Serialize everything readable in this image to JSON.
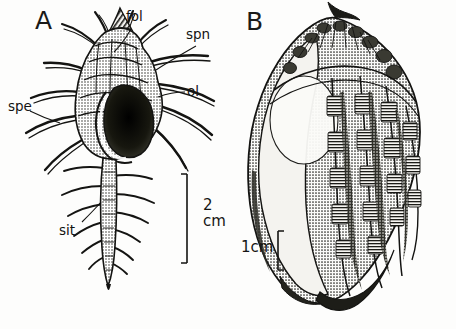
{
  "figure": {
    "background_color": "#fdfdfc",
    "ink_color": "#141412"
  },
  "panel_a": {
    "label": "A",
    "subject": "spiny-murex-shell-apertural-view",
    "annotations": [
      {
        "key": "fol",
        "text": "fol",
        "x": 126,
        "y": 10
      },
      {
        "key": "spn",
        "text": "spn",
        "x": 186,
        "y": 28
      },
      {
        "key": "ol",
        "text": "ol",
        "x": 187,
        "y": 85
      },
      {
        "key": "spe",
        "text": "spe",
        "x": 8,
        "y": 100
      },
      {
        "key": "sit",
        "text": "sit",
        "x": 59,
        "y": 224
      }
    ],
    "scale_bar": {
      "value": "2",
      "unit": "cm",
      "text_x": 203,
      "text_y": 198
    }
  },
  "panel_b": {
    "label": "B",
    "subject": "ribbed-banded-shell-dorsal-view",
    "scale_bar": {
      "text": "1cm",
      "text_x": 241,
      "text_y": 240
    }
  }
}
